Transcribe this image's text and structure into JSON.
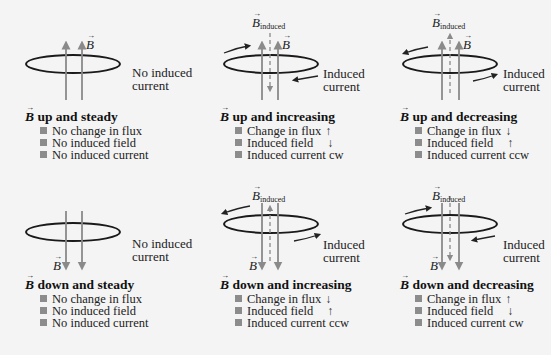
{
  "panels": [
    {
      "id": "up-steady",
      "title_rest": " up and steady",
      "field_direction": "up",
      "induced_label": [
        "No induced",
        "current"
      ],
      "b_label": "B",
      "b_induced_label": null,
      "bullets": [
        {
          "text": "No change in flux",
          "arrow": ""
        },
        {
          "text": "No induced field",
          "arrow": ""
        },
        {
          "text": "No induced current",
          "arrow": ""
        }
      ]
    },
    {
      "id": "up-increasing",
      "title_rest": " up and increasing",
      "field_direction": "up",
      "induced_label": [
        "Induced",
        "current"
      ],
      "b_label": "B",
      "b_induced_label": "B",
      "b_induced_sub": "induced",
      "bullets": [
        {
          "text": "Change in flux",
          "arrow": "↑"
        },
        {
          "text": "Induced field",
          "arrow": "↓"
        },
        {
          "text": "Induced current cw",
          "arrow": ""
        }
      ]
    },
    {
      "id": "up-decreasing",
      "title_rest": " up and decreasing",
      "field_direction": "up",
      "induced_label": [
        "Induced",
        "current"
      ],
      "b_label": "B",
      "b_induced_label": "B",
      "b_induced_sub": "induced",
      "bullets": [
        {
          "text": "Change in flux",
          "arrow": "↓"
        },
        {
          "text": "Induced field",
          "arrow": "↑"
        },
        {
          "text": "Induced current ccw",
          "arrow": ""
        }
      ]
    },
    {
      "id": "down-steady",
      "title_rest": " down and steady",
      "field_direction": "down",
      "induced_label": [
        "No induced",
        "current"
      ],
      "b_label": "B",
      "b_induced_label": null,
      "bullets": [
        {
          "text": "No change in flux",
          "arrow": ""
        },
        {
          "text": "No induced field",
          "arrow": ""
        },
        {
          "text": "No induced current",
          "arrow": ""
        }
      ]
    },
    {
      "id": "down-increasing",
      "title_rest": " down and increasing",
      "field_direction": "down",
      "induced_label": [
        "Induced",
        "current"
      ],
      "b_label": "B",
      "b_induced_label": "B",
      "b_induced_sub": "induced",
      "bullets": [
        {
          "text": "Change in flux",
          "arrow": "↓"
        },
        {
          "text": "Induced field",
          "arrow": "↑"
        },
        {
          "text": "Induced current ccw",
          "arrow": ""
        }
      ]
    },
    {
      "id": "down-decreasing",
      "title_rest": " down and decreasing",
      "field_direction": "down",
      "induced_label": [
        "Induced",
        "current"
      ],
      "b_label": "B",
      "b_induced_label": "B",
      "b_induced_sub": "induced",
      "bullets": [
        {
          "text": "Change in flux",
          "arrow": "↑"
        },
        {
          "text": "Induced field",
          "arrow": "↓"
        },
        {
          "text": "Induced current cw",
          "arrow": ""
        }
      ]
    }
  ],
  "colors": {
    "loop": "#1a1a1a",
    "field_arrow": "#8a8a8a",
    "induced_arrow": "#8a8a8a",
    "bullet": "#8c8c8c",
    "background": "#f4f4f4"
  }
}
